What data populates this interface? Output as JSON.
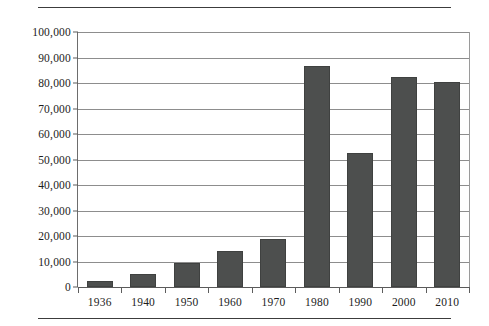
{
  "chart_data": {
    "type": "bar",
    "title": "",
    "subtitle": "",
    "xlabel": "",
    "ylabel": "",
    "categories": [
      "1936",
      "1940",
      "1950",
      "1960",
      "1970",
      "1980",
      "1990",
      "2000",
      "2010"
    ],
    "values": [
      2500,
      5000,
      9500,
      14000,
      19000,
      86500,
      52500,
      82500,
      80500
    ],
    "ylim": [
      0,
      100000
    ],
    "ytick_values": [
      0,
      10000,
      20000,
      30000,
      40000,
      50000,
      60000,
      70000,
      80000,
      90000,
      100000
    ],
    "ytick_labels": [
      "0",
      "10,000",
      "20,000",
      "30,000",
      "40,000",
      "50,000",
      "60,000",
      "70,000",
      "80,000",
      "90,000",
      "100,000"
    ],
    "grid": true,
    "legend": null,
    "legend_position": "none",
    "bar_color": "#4d4f4e",
    "plot_background": "#ffffff",
    "gridline_color": "#8d8d8d",
    "axis_color": "#5a5a5a"
  },
  "decorations": {
    "top_rule_color": "#3c3c3c",
    "bottom_rule_color": "#3c3c3c"
  }
}
